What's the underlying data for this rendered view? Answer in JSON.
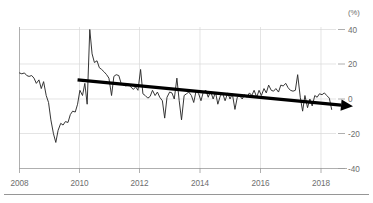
{
  "chart_data": {
    "type": "line",
    "title": "",
    "subtitle": "",
    "xlabel": "",
    "ylabel": "",
    "unit_label": "(%)",
    "xlim": [
      2008.0,
      2018.9
    ],
    "ylim": [
      -44,
      45
    ],
    "yticks": [
      40,
      20,
      0,
      -20,
      -40
    ],
    "ytick_labels": [
      "40",
      "20",
      "0",
      "-20",
      "-40"
    ],
    "xticks": [
      2008,
      2010,
      2012,
      2014,
      2016,
      2018
    ],
    "xtick_labels": [
      "2008",
      "2010",
      "2012",
      "2014",
      "2016",
      "2018"
    ],
    "grid": true,
    "legend": "none",
    "series": [
      {
        "name": "series-1",
        "role": "data",
        "x": [
          2008.0,
          2008.08,
          2008.17,
          2008.25,
          2008.33,
          2008.42,
          2008.5,
          2008.58,
          2008.67,
          2008.75,
          2008.83,
          2008.92,
          2009.0,
          2009.08,
          2009.17,
          2009.25,
          2009.33,
          2009.42,
          2009.5,
          2009.58,
          2009.67,
          2009.75,
          2009.83,
          2009.92,
          2010.0,
          2010.08,
          2010.17,
          2010.25,
          2010.33,
          2010.42,
          2010.5,
          2010.58,
          2010.67,
          2010.75,
          2010.83,
          2010.92,
          2011.0,
          2011.08,
          2011.17,
          2011.25,
          2011.33,
          2011.42,
          2011.5,
          2011.58,
          2011.67,
          2011.75,
          2011.83,
          2011.92,
          2012.0,
          2012.08,
          2012.17,
          2012.25,
          2012.33,
          2012.42,
          2012.5,
          2012.58,
          2012.67,
          2012.75,
          2012.83,
          2012.92,
          2013.0,
          2013.08,
          2013.17,
          2013.25,
          2013.33,
          2013.42,
          2013.5,
          2013.58,
          2013.67,
          2013.75,
          2013.83,
          2013.92,
          2014.0,
          2014.08,
          2014.17,
          2014.25,
          2014.33,
          2014.42,
          2014.5,
          2014.58,
          2014.67,
          2014.75,
          2014.83,
          2014.92,
          2015.0,
          2015.08,
          2015.17,
          2015.25,
          2015.33,
          2015.42,
          2015.5,
          2015.58,
          2015.67,
          2015.75,
          2015.83,
          2015.92,
          2016.0,
          2016.08,
          2016.17,
          2016.25,
          2016.33,
          2016.42,
          2016.5,
          2016.58,
          2016.67,
          2016.75,
          2016.83,
          2016.92,
          2017.0,
          2017.08,
          2017.17,
          2017.25,
          2017.33,
          2017.42,
          2017.5,
          2017.58,
          2017.67,
          2017.75,
          2017.83,
          2017.92,
          2018.0,
          2018.08,
          2018.17,
          2018.25,
          2018.33,
          2018.42,
          2018.5,
          2018.58,
          2018.67,
          2018.75
        ],
        "y": [
          15.0,
          14.5,
          15.0,
          13.5,
          13.0,
          13.5,
          12.0,
          9.0,
          11.0,
          6.0,
          10.0,
          2.0,
          -2.0,
          -12.0,
          -20.0,
          -25.0,
          -18.0,
          -14.0,
          -15.0,
          -13.0,
          -13.5,
          -9.0,
          -7.0,
          -7.5,
          -3.0,
          5.0,
          2.0,
          9.0,
          -3.0,
          40.0,
          26.0,
          21.0,
          22.0,
          18.0,
          17.0,
          15.5,
          14.0,
          12.0,
          2.0,
          13.0,
          14.0,
          13.5,
          9.0,
          8.0,
          7.5,
          8.5,
          7.0,
          5.5,
          7.0,
          5.0,
          17.0,
          3.0,
          2.0,
          0.5,
          1.5,
          5.0,
          2.0,
          4.0,
          1.0,
          -1.0,
          -11.0,
          1.0,
          4.0,
          3.5,
          0.0,
          12.0,
          -1.0,
          -12.0,
          2.0,
          3.0,
          4.0,
          2.0,
          -2.0,
          4.5,
          3.0,
          -1.0,
          4.0,
          5.0,
          1.0,
          4.5,
          0.0,
          4.0,
          -3.0,
          2.0,
          3.0,
          -1.0,
          3.5,
          0.0,
          3.0,
          -6.0,
          1.0,
          2.0,
          0.0,
          2.5,
          1.0,
          3.5,
          2.0,
          5.0,
          1.0,
          5.0,
          2.0,
          6.0,
          3.5,
          8.0,
          5.0,
          4.5,
          6.0,
          4.0,
          8.0,
          7.5,
          9.0,
          6.5,
          5.0,
          4.5,
          5.0,
          14.0,
          1.0,
          -7.0,
          2.0,
          -5.0,
          0.0,
          -4.0,
          2.0,
          1.0,
          3.0,
          2.5,
          3.5,
          2.0,
          0.5,
          -6.0
        ]
      },
      {
        "name": "trend-arrow",
        "role": "annotation-trend",
        "x": [
          2010.0,
          2018.9
        ],
        "y": [
          11.0,
          -3.0
        ]
      }
    ]
  },
  "axis": {
    "unit_label": "(%)",
    "y_labels": [
      "40",
      "20",
      "0",
      "-20",
      "-40"
    ],
    "x_labels": [
      "2008",
      "2010",
      "2012",
      "2014",
      "2016",
      "2018"
    ]
  }
}
